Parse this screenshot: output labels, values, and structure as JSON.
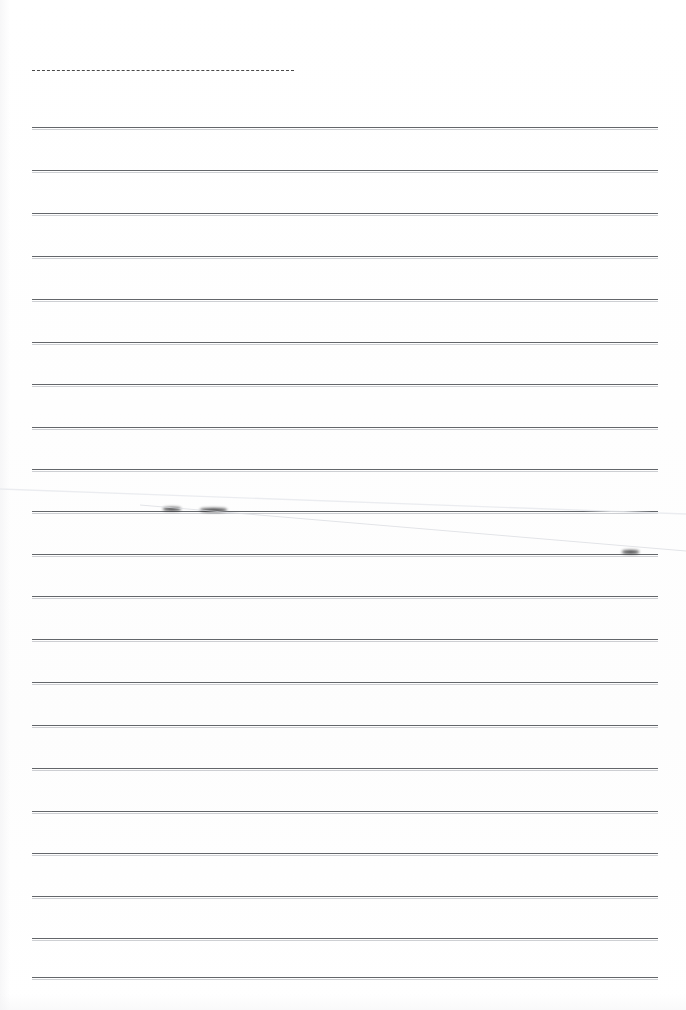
{
  "document": {
    "kind": "scanned-lined-paper",
    "title": "Blank ruled notebook page",
    "width": 686,
    "height": 1010,
    "background_color": "#ffffff",
    "page_text": "",
    "handwriting_present": "none"
  },
  "layout": {
    "left_margin_x": 32,
    "right_margin_x": 658,
    "line_length": 626,
    "line_spacing": 42.8,
    "first_rule_y": 127,
    "rule_count": 20
  },
  "header_rule": {
    "type": "dashed",
    "x": 32,
    "y": 70,
    "width": 262,
    "color": "#3a3a3a",
    "dash": "4px dash, 2px gap",
    "thickness": 1.4
  },
  "rules": [
    {
      "index": 1,
      "y": 127,
      "x": 32,
      "width": 626
    },
    {
      "index": 2,
      "y": 170,
      "x": 32,
      "width": 626
    },
    {
      "index": 3,
      "y": 213,
      "x": 32,
      "width": 626
    },
    {
      "index": 4,
      "y": 256,
      "x": 32,
      "width": 626
    },
    {
      "index": 5,
      "y": 299,
      "x": 32,
      "width": 626
    },
    {
      "index": 6,
      "y": 342,
      "x": 32,
      "width": 626
    },
    {
      "index": 7,
      "y": 384,
      "x": 32,
      "width": 626
    },
    {
      "index": 8,
      "y": 427,
      "x": 32,
      "width": 626
    },
    {
      "index": 9,
      "y": 469,
      "x": 32,
      "width": 626
    },
    {
      "index": 10,
      "y": 511,
      "x": 32,
      "width": 626
    },
    {
      "index": 11,
      "y": 554,
      "x": 32,
      "width": 626
    },
    {
      "index": 12,
      "y": 596,
      "x": 32,
      "width": 626
    },
    {
      "index": 13,
      "y": 639,
      "x": 32,
      "width": 626
    },
    {
      "index": 14,
      "y": 682,
      "x": 32,
      "width": 626
    },
    {
      "index": 15,
      "y": 725,
      "x": 32,
      "width": 626
    },
    {
      "index": 16,
      "y": 768,
      "x": 32,
      "width": 626
    },
    {
      "index": 17,
      "y": 811,
      "x": 32,
      "width": 626
    },
    {
      "index": 18,
      "y": 853,
      "x": 32,
      "width": 626
    },
    {
      "index": 19,
      "y": 896,
      "x": 32,
      "width": 626
    },
    {
      "index": 20,
      "y": 938,
      "x": 32,
      "width": 626
    },
    {
      "index": 21,
      "y": 977,
      "x": 32,
      "width": 626
    }
  ],
  "rule_style": {
    "color": "#5b5e63",
    "thickness": 1,
    "halo_color": "#8c9198"
  },
  "marks": [
    {
      "name": "ink-smudge-a",
      "x": 163,
      "y": 509,
      "width": 18,
      "height": 3.4,
      "color": "#1e1e20",
      "blur": "soft"
    },
    {
      "name": "ink-smudge-b",
      "x": 200,
      "y": 510,
      "width": 27,
      "height": 3.6,
      "color": "#1e1e20",
      "blur": "soft"
    },
    {
      "name": "ink-smudge-c",
      "x": 622,
      "y": 552,
      "width": 17,
      "height": 3.4,
      "color": "#1e1e20",
      "blur": "soft"
    }
  ],
  "artifacts": [
    {
      "name": "scan-crease-upper",
      "type": "diagonal-line",
      "x1": 0,
      "y1": 489,
      "x2": 686,
      "y2": 514,
      "color": "#e8eaee"
    },
    {
      "name": "scan-crease-lower",
      "type": "diagonal-line",
      "x1": 140,
      "y1": 505,
      "x2": 686,
      "y2": 551,
      "color": "#d9dbe0"
    }
  ]
}
